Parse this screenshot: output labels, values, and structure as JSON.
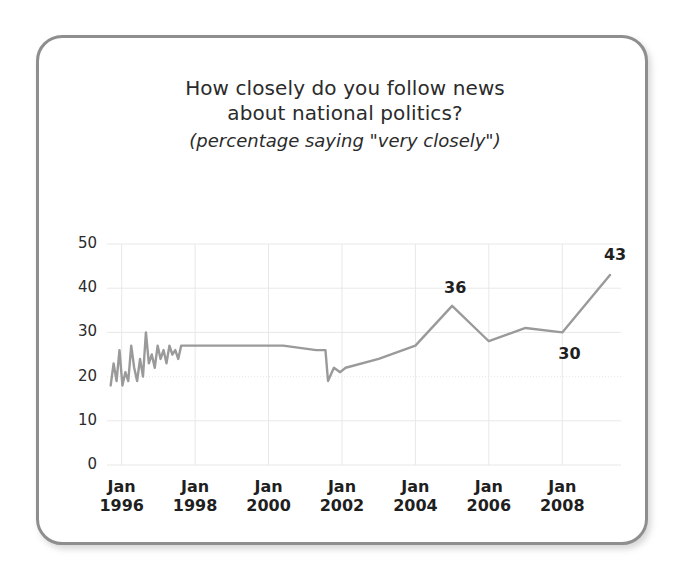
{
  "figure": {
    "title_line_1": "How closely do you follow news",
    "title_line_2": "about national politics?",
    "subtitle": "(percentage saying \"very closely\")",
    "frame_color": "#8e8e8e",
    "line_color": "#9a9a9a",
    "grid_color": "#e8e8e8",
    "text_color": "#2b2b2b",
    "background": "#ffffff"
  },
  "axes": {
    "y_ticks": [
      "0",
      "10",
      "20",
      "30",
      "40",
      "50"
    ],
    "x_ticks": [
      {
        "month": "Jan",
        "year": "1996"
      },
      {
        "month": "Jan",
        "year": "1998"
      },
      {
        "month": "Jan",
        "year": "2000"
      },
      {
        "month": "Jan",
        "year": "2002"
      },
      {
        "month": "Jan",
        "year": "2004"
      },
      {
        "month": "Jan",
        "year": "2006"
      },
      {
        "month": "Jan",
        "year": "2008"
      }
    ]
  },
  "annotations": [
    {
      "name": "peak-2005",
      "text": "36"
    },
    {
      "name": "trough-2008",
      "text": "30"
    },
    {
      "name": "end-2009",
      "text": "43"
    }
  ],
  "chart_data": {
    "type": "line",
    "title": "How closely do you follow news about national politics?",
    "subtitle": "(percentage saying \"very closely\")",
    "xlabel": "",
    "ylabel": "",
    "ylim": [
      0,
      50
    ],
    "xlim": [
      1995.6,
      2009.6
    ],
    "ytick_values": [
      0,
      10,
      20,
      30,
      40,
      50
    ],
    "xtick_values": [
      1996,
      1998,
      2000,
      2002,
      2004,
      2006,
      2008
    ],
    "xtick_labels": [
      "Jan 1996",
      "Jan 1998",
      "Jan 2000",
      "Jan 2002",
      "Jan 2004",
      "Jan 2006",
      "Jan 2008"
    ],
    "grid": true,
    "legend": null,
    "series": [
      {
        "name": "percentage saying \"very closely\"",
        "color": "#9a9a9a",
        "x": [
          1995.7,
          1995.78,
          1995.86,
          1995.94,
          1996.02,
          1996.1,
          1996.18,
          1996.26,
          1996.34,
          1996.42,
          1996.5,
          1996.58,
          1996.66,
          1996.74,
          1996.82,
          1996.9,
          1996.98,
          1997.06,
          1997.14,
          1997.22,
          1997.3,
          1997.38,
          1997.46,
          1997.54,
          1997.62,
          1997.7,
          1998.0,
          2000.4,
          2001.3,
          2001.55,
          2001.62,
          2001.78,
          2001.95,
          2002.1,
          2003.0,
          2004.0,
          2005.0,
          2006.0,
          2007.0,
          2008.0,
          2009.3
        ],
        "y": [
          18,
          23,
          19,
          26,
          18,
          21,
          19,
          27,
          22,
          19,
          24,
          20,
          30,
          23,
          25,
          22,
          27,
          24,
          26,
          23,
          27,
          25,
          26,
          24,
          27,
          27,
          27,
          27,
          26,
          26,
          19,
          22,
          21,
          22,
          24,
          27,
          36,
          28,
          31,
          30,
          43
        ]
      }
    ],
    "annotated_points": [
      {
        "x": 2005.0,
        "y": 36,
        "label": "36"
      },
      {
        "x": 2008.0,
        "y": 30,
        "label": "30"
      },
      {
        "x": 2009.3,
        "y": 43,
        "label": "43"
      }
    ]
  }
}
